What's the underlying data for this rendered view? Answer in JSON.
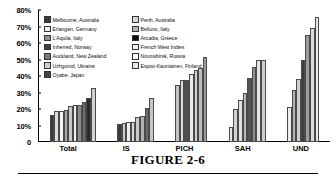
{
  "caption": {
    "title": "FIGURE 2-6"
  },
  "chart_data": {
    "type": "bar",
    "title": "",
    "xlabel": "",
    "ylabel": "",
    "ylim": [
      0,
      80
    ],
    "grid": false,
    "legend_position": "top-left-inside",
    "y_ticks": [
      "0",
      "10%",
      "20%",
      "30%",
      "40%",
      "50%",
      "60%",
      "70%",
      "80%"
    ],
    "y_tick_values": [
      0,
      10,
      20,
      30,
      40,
      50,
      60,
      70,
      80
    ],
    "categories": [
      "Total",
      "IS",
      "PICH",
      "SAH",
      "UND"
    ],
    "series": [
      {
        "name": "Melbourne, Australia",
        "color": "#3a3a3a",
        "values": [
          16.5,
          11.0,
          null,
          9.0,
          null
        ]
      },
      {
        "name": "Perth, Australia",
        "color": "#d9d9d9",
        "values": [
          19.0,
          11.8,
          34.5,
          19.8,
          21.3
        ]
      },
      {
        "name": "Erlangen, Germany",
        "color": "#f0f0f0",
        "values": [
          19.0,
          12.0,
          37.5,
          25.3,
          null
        ]
      },
      {
        "name": "Belluno, Italy",
        "color": "#9e9e9e",
        "values": [
          19.5,
          12.3,
          37.5,
          29.5,
          31.5
        ]
      },
      {
        "name": "L'Aquila, Italy",
        "color": "#c2c2c2",
        "values": [
          22.0,
          15.0,
          41.5,
          38.5,
          38.0
        ]
      },
      {
        "name": "Arcadia, Greece",
        "color": "#1a1a1a",
        "values": [
          22.5,
          15.8,
          43.5,
          45.2,
          50.0
        ]
      },
      {
        "name": "Inherred, Norway",
        "color": "#5c5c5c",
        "values": [
          22.5,
          20.5,
          45.0,
          50.0,
          65.0
        ]
      },
      {
        "name": "French West Indies",
        "color": "#ededed",
        "values": [
          24.0,
          26.5,
          51.5,
          50.0,
          69.0
        ]
      },
      {
        "name": "Auckland, New Zealand",
        "color": "#7a7a7a",
        "values": [
          26.5,
          null,
          null,
          null,
          76.0
        ]
      },
      {
        "name": "Novosibirsk, Russia",
        "color": "#fafafa",
        "values": [
          null,
          null,
          null,
          null,
          null
        ]
      },
      {
        "name": "Uzhgorod, Ukraine",
        "color": "#cfcfcf",
        "values": [
          null,
          null,
          null,
          null,
          null
        ]
      },
      {
        "name": "Espoo-Kauniainen, Finland",
        "color": "#e3e3e3",
        "values": [
          33.0,
          null,
          null,
          null,
          null
        ]
      },
      {
        "name": "Oyabe, Japan",
        "color": "#444444",
        "values": [
          null,
          null,
          null,
          null,
          null
        ]
      }
    ],
    "legend_left_column": [
      {
        "label": "Melbourne, Australia",
        "color": "#3a3a3a"
      },
      {
        "label": "Erlangen, Germany",
        "color": "#f0f0f0"
      },
      {
        "label": "L'Aquila, Italy",
        "color": "#8f8f8f"
      },
      {
        "label": "Inherred, Norway",
        "color": "#3f3f3f"
      },
      {
        "label": "Auckland, New Zealand",
        "color": "#7a7a7a"
      },
      {
        "label": "Uzhgorod, Ukraine",
        "color": "#cfcfcf"
      },
      {
        "label": "Oyabe, Japan",
        "color": "#444444"
      }
    ],
    "legend_right_column": [
      {
        "label": "Perth, Australia",
        "color": "#d9d9d9"
      },
      {
        "label": "Belluno, Italy",
        "color": "#b5b5b5"
      },
      {
        "label": "Arcadia, Greece",
        "color": "#101010"
      },
      {
        "label": "French West Indies",
        "color": "#f4f4f4"
      },
      {
        "label": "Novosibirsk, Russia",
        "color": "#fbfbfb"
      },
      {
        "label": "Espoo-Kauniainen, Finland",
        "color": "#e8e8e8"
      }
    ],
    "group_bars": {
      "Total": [
        {
          "value": 16.5,
          "color": "#3a3a3a"
        },
        {
          "value": 19.0,
          "color": "#dcdcdc"
        },
        {
          "value": 19.0,
          "color": "#f2f2f2"
        },
        {
          "value": 19.5,
          "color": "#a8a8a8"
        },
        {
          "value": 22.0,
          "color": "#c9c9c9"
        },
        {
          "value": 22.5,
          "color": "#efefef"
        },
        {
          "value": 22.5,
          "color": "#8c8c8c"
        },
        {
          "value": 24.0,
          "color": "#6e6e6e"
        },
        {
          "value": 26.5,
          "color": "#2b2b2b"
        },
        {
          "value": 33.0,
          "color": "#d2d2d2"
        }
      ],
      "IS": [
        {
          "value": 11.0,
          "color": "#3a3a3a"
        },
        {
          "value": 11.8,
          "color": "#c9c9c9"
        },
        {
          "value": 12.0,
          "color": "#ededed"
        },
        {
          "value": 12.3,
          "color": "#dadada"
        },
        {
          "value": 15.0,
          "color": "#cacaca"
        },
        {
          "value": 15.8,
          "color": "#b0b0b0"
        },
        {
          "value": 20.5,
          "color": "#6b6b6b"
        },
        {
          "value": 26.5,
          "color": "#c6c6c6"
        }
      ],
      "PICH": [
        {
          "value": 34.5,
          "color": "#c4c4c4"
        },
        {
          "value": 37.5,
          "color": "#dedede"
        },
        {
          "value": 37.5,
          "color": "#4f4f4f"
        },
        {
          "value": 41.5,
          "color": "#e9e9e9"
        },
        {
          "value": 43.5,
          "color": "#cfcfcf"
        },
        {
          "value": 45.0,
          "color": "#bdbdbd"
        },
        {
          "value": 51.5,
          "color": "#9a9a9a"
        }
      ],
      "SAH": [
        {
          "value": 9.0,
          "color": "#e6e6e6"
        },
        {
          "value": 19.8,
          "color": "#d2d2d2"
        },
        {
          "value": 25.3,
          "color": "#e0e0e0"
        },
        {
          "value": 29.5,
          "color": "#b8b8b8"
        },
        {
          "value": 38.5,
          "color": "#515151"
        },
        {
          "value": 45.2,
          "color": "#8e8e8e"
        },
        {
          "value": 50.0,
          "color": "#e4e4e4"
        },
        {
          "value": 50.0,
          "color": "#cdcdcd"
        }
      ],
      "UND": [
        {
          "value": 21.3,
          "color": "#ececec"
        },
        {
          "value": 31.5,
          "color": "#b4b4b4"
        },
        {
          "value": 38.0,
          "color": "#cecece"
        },
        {
          "value": 50.0,
          "color": "#3d3d3d"
        },
        {
          "value": 65.0,
          "color": "#9b9b9b"
        },
        {
          "value": 69.0,
          "color": "#dadada"
        },
        {
          "value": 76.0,
          "color": "#e6e6e6"
        }
      ]
    }
  }
}
